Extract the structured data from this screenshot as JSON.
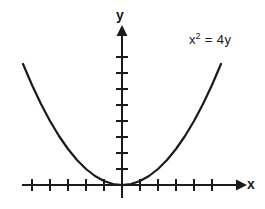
{
  "figure": {
    "background_color": "#ffffff",
    "stroke_color": "#1a1a1a",
    "axis_color": "#1a1a1a"
  },
  "labels": {
    "y_axis": "y",
    "x_axis": "x"
  },
  "annotation": {
    "full_text": "x² = 4y",
    "base": "x",
    "exponent": "2",
    "remainder": " = 4y"
  },
  "chart_data": {
    "type": "line",
    "title": "",
    "subtitle": "",
    "xlabel": "x",
    "ylabel": "y",
    "annotations": [
      "x² = 4y"
    ],
    "equation": "x^2 = 4y",
    "equation_solved": "y = x^2 / 4",
    "grid": false,
    "legend": null,
    "xlim": [
      -6.5,
      6.5
    ],
    "ylim": [
      -0.8,
      9.5
    ],
    "x_ticks": [
      -5,
      -4,
      -3,
      -2,
      -1,
      1,
      2,
      3,
      4,
      5
    ],
    "y_ticks": [
      1,
      2,
      3,
      4,
      5,
      6,
      7,
      8
    ],
    "x_tick_labels": [],
    "y_tick_labels": [],
    "axis_arrows": [
      "x-positive",
      "y-positive"
    ],
    "vertex": [
      0,
      0
    ],
    "focus": [
      0,
      1
    ],
    "directrix": "y = -1",
    "opens": "up",
    "series": [
      {
        "name": "x^2 = 4y",
        "x": [
          -5.5,
          -5.0,
          -4.5,
          -4.0,
          -3.5,
          -3.0,
          -2.5,
          -2.0,
          -1.5,
          -1.0,
          -0.5,
          0.0,
          0.5,
          1.0,
          1.5,
          2.0,
          2.5,
          3.0,
          3.5,
          4.0,
          4.5,
          5.0,
          5.5
        ],
        "y": [
          7.5625,
          6.25,
          5.0625,
          4.0,
          3.0625,
          2.25,
          1.5625,
          1.0,
          0.5625,
          0.25,
          0.0625,
          0.0,
          0.0625,
          0.25,
          0.5625,
          1.0,
          1.5625,
          2.25,
          3.0625,
          4.0,
          5.0625,
          6.25,
          7.5625
        ]
      }
    ]
  }
}
